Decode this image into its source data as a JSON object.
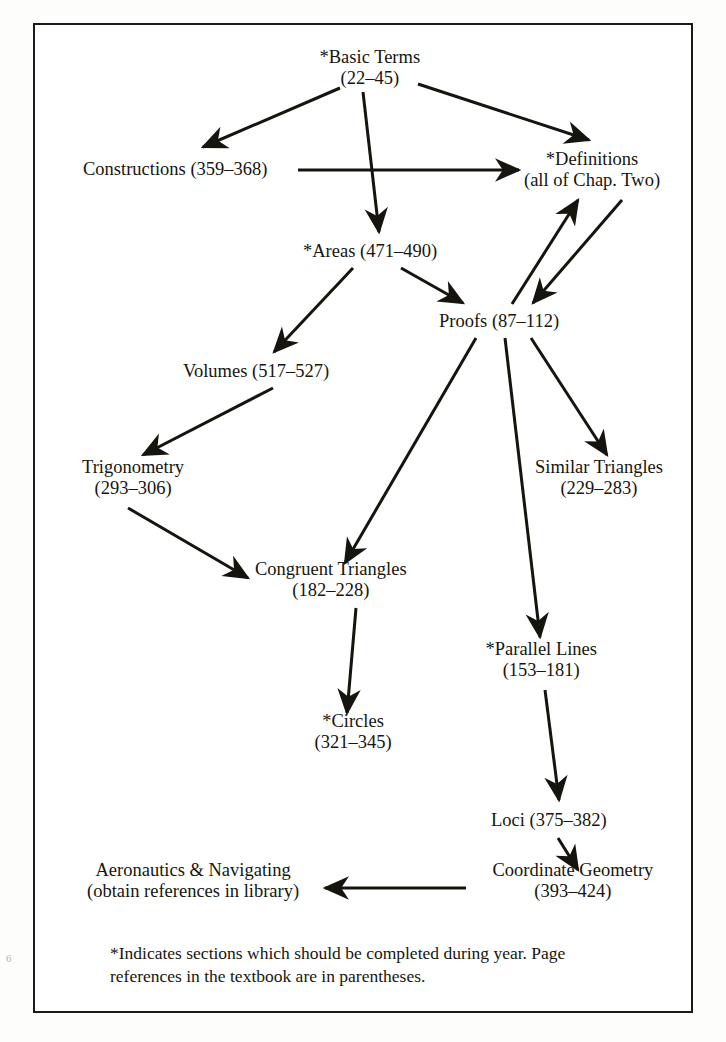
{
  "page": {
    "folio": "6",
    "border_color": "#1a1a1a",
    "ink_color": "#16150f"
  },
  "diagram": {
    "type": "flowchart",
    "nodes": [
      {
        "id": "basic_terms",
        "line1": "*Basic Terms",
        "line2": "(22–45)",
        "x": 370,
        "y": 68
      },
      {
        "id": "constructions",
        "line1": "Constructions (359–368)",
        "line2": "",
        "x": 175,
        "y": 170
      },
      {
        "id": "definitions",
        "line1": "*Definitions",
        "line2": "(all of Chap. Two)",
        "x": 592,
        "y": 170
      },
      {
        "id": "areas",
        "line1": "*Areas (471–490)",
        "line2": "",
        "x": 370,
        "y": 252
      },
      {
        "id": "proofs",
        "line1": "Proofs (87–112)",
        "line2": "",
        "x": 499,
        "y": 322
      },
      {
        "id": "volumes",
        "line1": "Volumes (517–527)",
        "line2": "",
        "x": 256,
        "y": 372
      },
      {
        "id": "trigonometry",
        "line1": "Trigonometry",
        "line2": "(293–306)",
        "x": 133,
        "y": 478
      },
      {
        "id": "similar_triangles",
        "line1": "Similar Triangles",
        "line2": "(229–283)",
        "x": 599,
        "y": 478
      },
      {
        "id": "congruent_triangles",
        "line1": "Congruent Triangles",
        "line2": "(182–228)",
        "x": 331,
        "y": 580
      },
      {
        "id": "parallel_lines",
        "line1": "*Parallel Lines",
        "line2": "(153–181)",
        "x": 541,
        "y": 660
      },
      {
        "id": "circles",
        "line1": "*Circles",
        "line2": "(321–345)",
        "x": 353,
        "y": 732
      },
      {
        "id": "loci",
        "line1": "Loci (375–382)",
        "line2": "",
        "x": 549,
        "y": 821
      },
      {
        "id": "coordinate_geometry",
        "line1": "Coordinate Geometry",
        "line2": "(393–424)",
        "x": 573,
        "y": 881
      },
      {
        "id": "aeronautics",
        "line1": "Aeronautics & Navigating",
        "line2": "(obtain references in library)",
        "x": 193,
        "y": 881
      }
    ],
    "edges": [
      {
        "from": "basic_terms",
        "to": "constructions",
        "label": ""
      },
      {
        "from": "basic_terms",
        "to": "definitions",
        "label": ""
      },
      {
        "from": "basic_terms",
        "to": "areas",
        "label": ""
      },
      {
        "from": "constructions",
        "to": "definitions",
        "label": ""
      },
      {
        "from": "areas",
        "to": "volumes",
        "label": ""
      },
      {
        "from": "areas",
        "to": "proofs",
        "label": ""
      },
      {
        "from": "definitions",
        "to": "proofs",
        "label": ""
      },
      {
        "from": "proofs",
        "to": "definitions",
        "label": ""
      },
      {
        "from": "volumes",
        "to": "trigonometry",
        "label": ""
      },
      {
        "from": "trigonometry",
        "to": "congruent_triangles",
        "label": ""
      },
      {
        "from": "proofs",
        "to": "congruent_triangles",
        "label": ""
      },
      {
        "from": "proofs",
        "to": "similar_triangles",
        "label": ""
      },
      {
        "from": "proofs",
        "to": "parallel_lines",
        "label": ""
      },
      {
        "from": "congruent_triangles",
        "to": "circles",
        "label": ""
      },
      {
        "from": "parallel_lines",
        "to": "loci",
        "label": ""
      },
      {
        "from": "loci",
        "to": "coordinate_geometry",
        "label": ""
      },
      {
        "from": "coordinate_geometry",
        "to": "aeronautics",
        "label": ""
      }
    ]
  },
  "footnote": {
    "line1": "*Indicates sections which should be completed during year.  Page",
    "line2": "references in the textbook are in parentheses."
  }
}
